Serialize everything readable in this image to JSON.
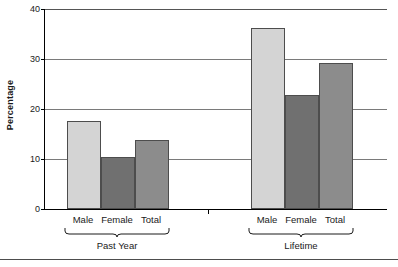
{
  "chart_data": {
    "type": "bar",
    "title": "",
    "xlabel": "",
    "ylabel": "Percentage",
    "ylim": [
      0,
      40
    ],
    "yticks": [
      0,
      10,
      20,
      30,
      40
    ],
    "ytick_labels": [
      "0",
      "10",
      "20",
      "30",
      "40"
    ],
    "grid": true,
    "legend": "none",
    "categories": [
      "Male",
      "Female",
      "Total"
    ],
    "groups": [
      {
        "name": "Past Year",
        "bars": [
          {
            "category": "Male",
            "value": 17.6,
            "color": "#d4d4d4"
          },
          {
            "category": "Female",
            "value": 10.4,
            "color": "#707070"
          },
          {
            "category": "Total",
            "value": 13.9,
            "color": "#8c8c8c"
          }
        ]
      },
      {
        "name": "Lifetime",
        "bars": [
          {
            "category": "Male",
            "value": 36.2,
            "color": "#d4d4d4"
          },
          {
            "category": "Female",
            "value": 22.8,
            "color": "#707070"
          },
          {
            "category": "Total",
            "value": 29.2,
            "color": "#8c8c8c"
          }
        ]
      }
    ],
    "colors": {
      "male_bar": "#d4d4d4",
      "female_bar": "#707070",
      "total_bar": "#8c8c8c",
      "axis": "#000000",
      "gridline": "#7a7a7a",
      "text": "#1a1a1a",
      "background": "#ffffff"
    }
  }
}
